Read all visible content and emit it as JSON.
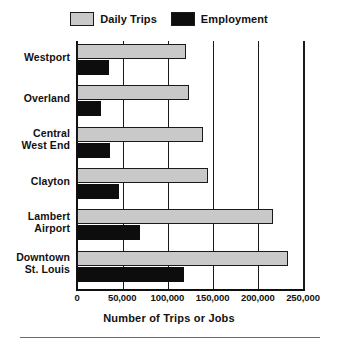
{
  "chart_data": {
    "type": "bar",
    "orientation": "horizontal",
    "title": "",
    "xlabel": "Number of Trips or Jobs",
    "ylabel": "",
    "xlim": [
      0,
      250000
    ],
    "xticks": [
      0,
      50000,
      100000,
      150000,
      200000,
      250000
    ],
    "xtick_labels": [
      "0",
      "50,000",
      "100,000",
      "150,000",
      "200,000",
      "250,000"
    ],
    "grid": true,
    "legend_position": "top-center",
    "categories": [
      "Westport",
      "Overland",
      "Central West End",
      "Clayton",
      "Lambert Airport",
      "Downtown St. Louis"
    ],
    "category_lines": [
      [
        "Westport"
      ],
      [
        "Overland"
      ],
      [
        "Central",
        "West End"
      ],
      [
        "Clayton"
      ],
      [
        "Lambert",
        "Airport"
      ],
      [
        "Downtown",
        "St. Louis"
      ]
    ],
    "series": [
      {
        "name": "Daily Trips",
        "color": "#c9c9c9",
        "values": [
          121000,
          124000,
          139000,
          145000,
          217000,
          233000
        ]
      },
      {
        "name": "Employment",
        "color": "#0d0d0d",
        "values": [
          35000,
          26500,
          36500,
          46500,
          70000,
          118000
        ]
      }
    ]
  },
  "legend": {
    "entries": [
      {
        "label": "Daily Trips",
        "swatch": "trips"
      },
      {
        "label": "Employment",
        "swatch": "employment"
      }
    ]
  },
  "colors": {
    "trips": "#c9c9c9",
    "employment": "#0d0d0d",
    "axis": "#111111",
    "background": "#ffffff"
  }
}
